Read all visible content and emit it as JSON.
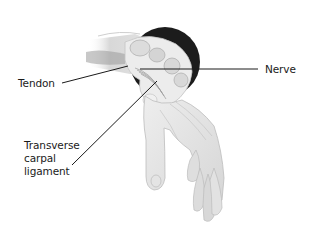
{
  "figure": {
    "labels": {
      "tendon": "Tendon",
      "nerve": "Nerve",
      "transverse_carpal_ligament": [
        "Transverse",
        "carpal",
        "ligament"
      ]
    },
    "colors": {
      "background": "#ffffff",
      "shadow_disc": "#1c1c1c",
      "skin": "#e6e6e6",
      "leader_line": "#1a1a1a",
      "text": "#1a1a1a"
    }
  }
}
